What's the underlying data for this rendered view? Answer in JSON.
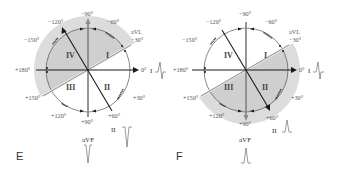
{
  "colors": {
    "shade": "#cfcfcf",
    "shade_outer": "#dadada",
    "axis_dark": "#1a1a1a",
    "axis_gray": "#8a8a8a",
    "circle": "#555555",
    "text": "#555555"
  },
  "panels": [
    {
      "id": "E",
      "letter": "E",
      "center": [
        88,
        70
      ],
      "radius": 42,
      "shaded_from_deg": -30,
      "shaded_to_deg": 150,
      "shaded_side": "upper",
      "quadrants": {
        "I": "I",
        "II": "II",
        "III": "III",
        "IV": "IV"
      },
      "angle_labels": {
        "m90": "−90°",
        "m60": "−60°",
        "m120": "−120°",
        "m150": "−150°",
        "m30": "−30°",
        "avl": "aVL",
        "zero": "0°",
        "p180": "+180°",
        "p150": "+150°",
        "p120": "+120°",
        "p90": "+90°",
        "p60": "+60°",
        "p30": "+30°"
      },
      "lead_I": {
        "label": "I",
        "waveform": "biphasic"
      },
      "lead_II": {
        "label": "II",
        "waveform": "negative"
      },
      "lead_aVF": {
        "label": "aVF",
        "waveform": "negative"
      },
      "axis_vector_deg": -120,
      "arc_notes": [
        "arc-label-left-upper",
        "arc-label-right-upper",
        "arc-label-right-lower",
        "arc-label-left-lower"
      ]
    },
    {
      "id": "F",
      "letter": "F",
      "center": [
        80,
        70
      ],
      "radius": 42,
      "shaded_from_deg": -30,
      "shaded_to_deg": 150,
      "shaded_side": "lower",
      "quadrants": {
        "I": "I",
        "II": "II",
        "III": "III",
        "IV": "IV"
      },
      "angle_labels": {
        "m90": "−90°",
        "m60": "−60°",
        "m120": "−120°",
        "m150": "−150°",
        "m30": "−30°",
        "avl": "aVL",
        "zero": "0°",
        "p180": "+180°",
        "p150": "+150°",
        "p120": "+120°",
        "p90": "+90°",
        "p60": "+60°",
        "p30": "+30°"
      },
      "lead_I": {
        "label": "I",
        "waveform": "biphasic"
      },
      "lead_II": {
        "label": "II",
        "waveform": "positive"
      },
      "lead_aVF": {
        "label": "aVF",
        "waveform": "positive"
      },
      "axis_vector_deg": 60
    }
  ]
}
